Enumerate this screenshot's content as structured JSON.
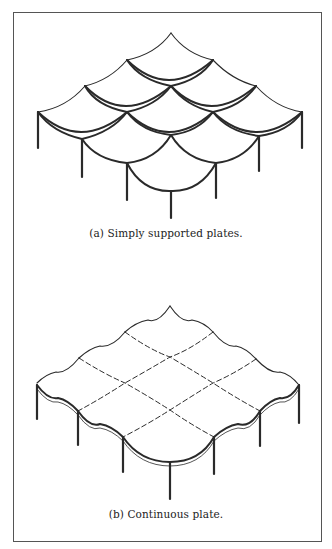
{
  "figure": {
    "panels": [
      {
        "id": "a",
        "caption": "(a)  Simply supported plates.",
        "description": "3x3 array of individually simply supported plates on columns, each plate sagging independently between supports"
      },
      {
        "id": "b",
        "caption": "(b)  Continuous plate.",
        "description": "Single continuous plate over 3x3 bays on columns, with dashed lines marking interior column lines"
      }
    ],
    "colors": {
      "line": "#2a2a2a",
      "frame": "#555555",
      "background": "#ffffff"
    }
  }
}
